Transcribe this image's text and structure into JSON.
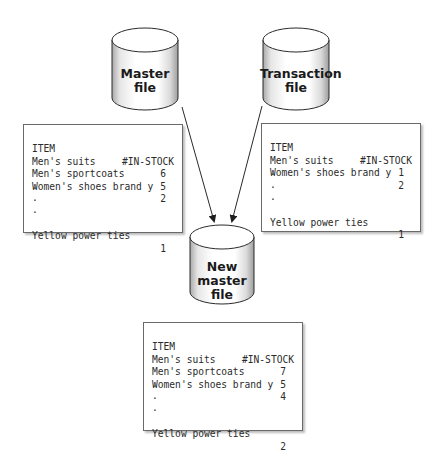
{
  "diagram": {
    "type": "file-update-process",
    "colors": {
      "line": "#2a2a2a",
      "cylinder_fill": "#ffffff",
      "cylinder_shade": "#b5b5b5",
      "box_border": "#6a6a6a"
    }
  },
  "cylinders": {
    "master": {
      "line1": "Master",
      "line2": "file"
    },
    "transaction": {
      "line1": "Transaction",
      "line2": "file"
    },
    "new_master": {
      "line1": "New",
      "line2": "master",
      "line3": "file"
    }
  },
  "tables": {
    "master": {
      "header": {
        "item": "ITEM",
        "qty": "#IN-STOCK"
      },
      "rows": [
        {
          "item": "Men's suits",
          "qty": "6"
        },
        {
          "item": "Men's sportcoats",
          "qty": "5"
        },
        {
          "item": "Women's shoes brand y",
          "qty": "2"
        }
      ],
      "ellipsis": [
        ".",
        ".",
        "."
      ],
      "last_row": {
        "item": "Yellow power ties",
        "qty": "1"
      }
    },
    "transaction": {
      "header": {
        "item": "ITEM",
        "qty": "#IN-STOCK"
      },
      "rows": [
        {
          "item": "Men's suits",
          "qty": "1"
        },
        {
          "item": "Women's shoes brand y",
          "qty": "2"
        }
      ],
      "ellipsis": [
        ".",
        ".",
        "."
      ],
      "last_row": {
        "item": "Yellow power ties",
        "qty": "1"
      }
    },
    "new_master": {
      "header": {
        "item": "ITEM",
        "qty": "#IN-STOCK"
      },
      "rows": [
        {
          "item": "Men's suits",
          "qty": "7"
        },
        {
          "item": "Men's sportcoats",
          "qty": "5"
        },
        {
          "item": "Women's shoes brand y",
          "qty": "4"
        }
      ],
      "ellipsis": [
        ".",
        ".",
        "."
      ],
      "last_row": {
        "item": "Yellow power ties",
        "qty": "2"
      }
    }
  }
}
